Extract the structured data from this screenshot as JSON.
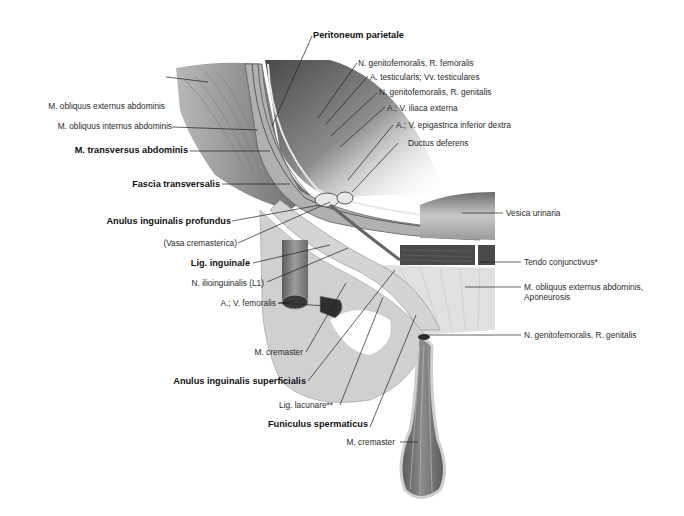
{
  "figure": {
    "colors": {
      "background": "#ffffff",
      "muscle_dark": "#6f6f6f",
      "muscle_mid": "#9a9a9a",
      "tissue_light": "#d6d6d6",
      "leader_line": "#222222",
      "text": "#222222"
    }
  },
  "labels": {
    "peritoneum_parietale": "Peritoneum parietale",
    "n_genitofemoralis_r_femoralis": "N. genitofemoralis, R. femoralis",
    "a_testicularis": "A. testicularis; Vv. testiculares",
    "n_genitofemoralis_r_genitalis_top": "N. genitofemoralis, R. genitalis",
    "a_v_iliaca_externa": "A.; V. iliaca externa",
    "a_v_epigastrica": "A.; V. epigastrica inferior dextra",
    "ductus_deferens": "Ductus deferens",
    "m_obliquus_externus": "M. obliquus externus abdominis",
    "m_obliquus_internus": "M. obliquus internus abdominis",
    "m_transversus": "M. transversus abdominis",
    "fascia_transversalis": "Fascia transversalis",
    "anulus_profundus": "Anulus inguinalis profundus",
    "vasa_cremasterica": "(Vasa cremasterica)",
    "lig_inguinale": "Lig. inguinale",
    "n_ilioinguinalis": "N. ilioinguinalis (L1)",
    "a_v_femoralis": "A.; V. femoralis",
    "m_cremaster_left": "M. cremaster",
    "anulus_superficialis": "Anulus inguinalis superficialis",
    "lig_lacunare": "Lig. lacunare**",
    "funiculus_spermaticus": "Funiculus spermaticus",
    "m_cremaster_bottom": "M. cremaster",
    "vesica_urinaria": "Vesica urinaria",
    "tendo_conjunctivus": "Tendo conjunctivus*",
    "m_obliquus_externus_aponeurosis_1": "M. obliquus externus abdominis,",
    "m_obliquus_externus_aponeurosis_2": "Aponeurosis",
    "n_genitofemoralis_r_genitalis_bottom": "N. genitofemoralis, R. genitalis"
  }
}
